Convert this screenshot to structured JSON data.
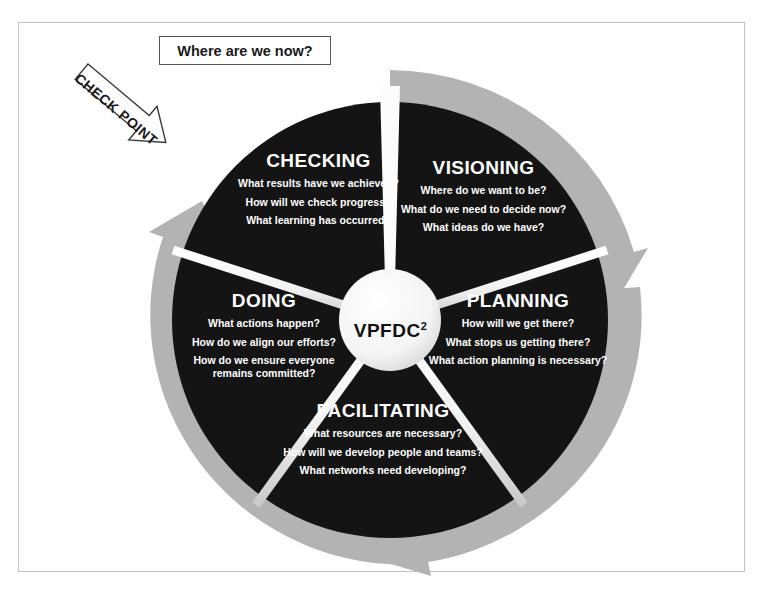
{
  "diagram": {
    "center_label": "VPFDC",
    "center_superscript": "2",
    "callout_label": "Where are we now?",
    "arrow_label": "CHECK POINT",
    "colors": {
      "segment_fill": "#141414",
      "ring_gray": "#b3b3b3",
      "segment_text": "#ffffff",
      "outline": "#555555",
      "background": "#ffffff"
    },
    "segments": [
      {
        "id": "visioning",
        "title": "VISIONING",
        "questions": [
          "Where do we want to be?",
          "What do we need to decide now?",
          "What ideas do we have?"
        ]
      },
      {
        "id": "planning",
        "title": "PLANNING",
        "questions": [
          "How will we get  there?",
          "What stops us getting there?",
          "What action planning is necessary?"
        ]
      },
      {
        "id": "facilitating",
        "title": "FACILITATING",
        "questions": [
          "What resources are necessary?",
          "How will we develop people and teams?",
          "What networks need developing?"
        ]
      },
      {
        "id": "doing",
        "title": "DOING",
        "questions": [
          "What actions happen?",
          "How do we align our efforts?",
          "How do we ensure everyone remains committed?"
        ]
      },
      {
        "id": "checking",
        "title": "CHECKING",
        "questions": [
          "What results have we achieved?",
          "How will we check progress?",
          "What learning has occurred?"
        ]
      }
    ]
  }
}
